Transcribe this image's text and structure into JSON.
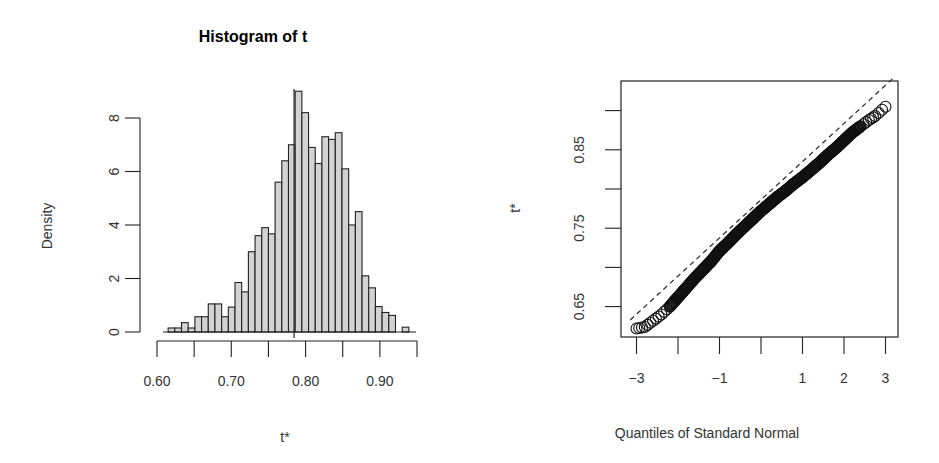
{
  "chart_data": [
    {
      "type": "bar",
      "subtype": "histogram",
      "title": "Histogram of t",
      "xlabel": "t*",
      "ylabel": "Density",
      "xlim": [
        0.6,
        0.95
      ],
      "ylim": [
        0,
        9
      ],
      "x_ticks": [
        "0.60",
        "0.70",
        "0.80",
        "0.90"
      ],
      "x_minor_ticks": [
        0.6,
        0.65,
        0.7,
        0.75,
        0.8,
        0.85,
        0.9,
        0.95
      ],
      "y_ticks": [
        "0",
        "2",
        "4",
        "6",
        "8"
      ],
      "bin_start": 0.615,
      "bin_width": 0.009,
      "values": [
        0.15,
        0.15,
        0.35,
        0.15,
        0.57,
        0.57,
        1.05,
        1.05,
        0.57,
        0.93,
        1.85,
        1.5,
        3.0,
        3.6,
        3.9,
        3.67,
        5.6,
        6.4,
        7.0,
        9.0,
        8.2,
        6.9,
        6.3,
        7.3,
        7.2,
        7.45,
        6.1,
        4.0,
        4.5,
        2.1,
        1.65,
        0.95,
        0.73,
        0.62,
        0.0,
        0.18
      ],
      "reference_line_x": 0.7845,
      "bar_fill": "#d3d3d3",
      "bar_stroke": "#222222",
      "grid": false
    },
    {
      "type": "scatter",
      "subtype": "normal-qq",
      "title": "",
      "xlabel": "Quantiles of Standard Normal",
      "ylabel": "t*",
      "xlim": [
        -3.15,
        3.3
      ],
      "ylim": [
        0.615,
        0.935
      ],
      "x_ticks": [
        "-3",
        "-1",
        "1",
        "2",
        "3"
      ],
      "x_tick_positions": [
        -3,
        -2,
        -1,
        0,
        1,
        2,
        3
      ],
      "y_ticks": [
        "0.65",
        "0.75",
        "0.85"
      ],
      "y_tick_positions": [
        0.65,
        0.7,
        0.75,
        0.8,
        0.85,
        0.9
      ],
      "curve_points": [
        [
          -3.0,
          0.622
        ],
        [
          -2.8,
          0.624
        ],
        [
          -2.6,
          0.632
        ],
        [
          -2.4,
          0.64
        ],
        [
          -2.2,
          0.65
        ],
        [
          -2.0,
          0.662
        ],
        [
          -1.8,
          0.674
        ],
        [
          -1.6,
          0.686
        ],
        [
          -1.4,
          0.697
        ],
        [
          -1.2,
          0.708
        ],
        [
          -1.0,
          0.721
        ],
        [
          -0.8,
          0.731
        ],
        [
          -0.6,
          0.742
        ],
        [
          -0.4,
          0.752
        ],
        [
          -0.2,
          0.762
        ],
        [
          0.0,
          0.772
        ],
        [
          0.2,
          0.781
        ],
        [
          0.4,
          0.79
        ],
        [
          0.6,
          0.798
        ],
        [
          0.8,
          0.807
        ],
        [
          1.0,
          0.815
        ],
        [
          1.2,
          0.824
        ],
        [
          1.4,
          0.833
        ],
        [
          1.6,
          0.843
        ],
        [
          1.8,
          0.852
        ],
        [
          2.0,
          0.862
        ],
        [
          2.2,
          0.872
        ],
        [
          2.4,
          0.88
        ],
        [
          2.6,
          0.888
        ],
        [
          2.75,
          0.893
        ],
        [
          3.0,
          0.905
        ]
      ],
      "reference_line": {
        "style": "dashed",
        "from": [
          -3.15,
          0.633
        ],
        "to": [
          3.2,
          0.942
        ]
      },
      "marker": "open-circle",
      "grid": false
    }
  ]
}
